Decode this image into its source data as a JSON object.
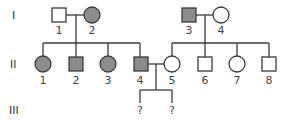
{
  "pedigree": {
    "colors": {
      "affected": "#8c8c8c",
      "unaffected": "#ffffff",
      "stroke": "#3a3a3a"
    },
    "generations": [
      {
        "label": "I",
        "individuals": [
          {
            "id": "1",
            "sex": "male",
            "affected": false
          },
          {
            "id": "2",
            "sex": "female",
            "affected": true
          },
          {
            "id": "3",
            "sex": "male",
            "affected": true
          },
          {
            "id": "4",
            "sex": "female",
            "affected": false
          }
        ]
      },
      {
        "label": "II",
        "individuals": [
          {
            "id": "1",
            "sex": "female",
            "affected": true
          },
          {
            "id": "2",
            "sex": "male",
            "affected": true
          },
          {
            "id": "3",
            "sex": "female",
            "affected": true
          },
          {
            "id": "4",
            "sex": "male",
            "affected": true
          },
          {
            "id": "5",
            "sex": "female",
            "affected": false
          },
          {
            "id": "6",
            "sex": "male",
            "affected": false
          },
          {
            "id": "7",
            "sex": "female",
            "affected": false
          },
          {
            "id": "8",
            "sex": "male",
            "affected": false
          }
        ]
      },
      {
        "label": "III",
        "individuals": [
          {
            "id": "?",
            "sex": "unknown",
            "affected": null
          },
          {
            "id": "?",
            "sex": "unknown",
            "affected": null
          }
        ]
      }
    ]
  }
}
